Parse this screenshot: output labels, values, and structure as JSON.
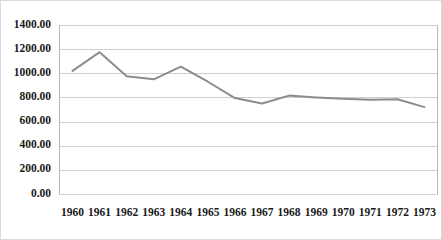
{
  "chart_data": {
    "type": "line",
    "title": "",
    "subtitle": "",
    "xlabel": "",
    "ylabel": "",
    "categories": [
      "1960",
      "1961",
      "1962",
      "1963",
      "1964",
      "1965",
      "1966",
      "1967",
      "1968",
      "1969",
      "1970",
      "1971",
      "1972",
      "1973"
    ],
    "series": [
      {
        "name": "series-1",
        "color": "#8c8c8c",
        "values": [
          1020,
          1175,
          975,
          950,
          1055,
          930,
          795,
          750,
          815,
          800,
          790,
          780,
          785,
          720
        ]
      }
    ],
    "ylim": [
      0,
      1400
    ],
    "ytick_step": 200,
    "ytick_labels": [
      "0.00",
      "200.00",
      "400.00",
      "600.00",
      "800.00",
      "1000.00",
      "1200.00",
      "1400.00"
    ],
    "ytick_values": [
      0,
      200,
      400,
      600,
      800,
      1000,
      1200,
      1400
    ],
    "grid": true,
    "grid_axis": "y",
    "legend": false,
    "legend_position": "none",
    "annotations": [],
    "background_color": "#ffffff",
    "gridline_color": "#d0d0d0",
    "border_color": "#d9d9d9"
  },
  "plot_geometry": {
    "left": 58,
    "right": 437,
    "top": 24,
    "bottom": 193
  }
}
